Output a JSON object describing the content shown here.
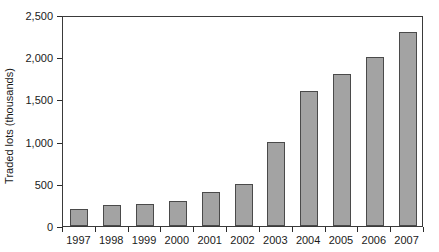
{
  "chart_data": {
    "type": "bar",
    "title": "",
    "subtitle": "",
    "xlabel": "",
    "ylabel": "Traded lots (thousands)",
    "categories": [
      "1997",
      "1998",
      "1999",
      "2000",
      "2001",
      "2002",
      "2003",
      "2004",
      "2005",
      "2006",
      "2007"
    ],
    "values": [
      200,
      250,
      260,
      300,
      400,
      500,
      1000,
      1600,
      1800,
      2000,
      2300
    ],
    "series": [
      {
        "name": "Traded lots",
        "values": [
          200,
          250,
          260,
          300,
          400,
          500,
          1000,
          1600,
          1800,
          2000,
          2300
        ]
      }
    ],
    "ylim": [
      0,
      2500
    ],
    "ytick_values": [
      0,
      500,
      1000,
      1500,
      2000,
      2500
    ],
    "ytick_labels": [
      "0",
      "500",
      "1,000",
      "1,500",
      "2,000",
      "2,500"
    ],
    "grid": false,
    "legend": false,
    "legend_position": "none",
    "bar_color": "#a3a3a3",
    "bar_edge_color": "#4a4a4a",
    "axis_color": "#3a3a3a",
    "text_color": "#1a1a1a",
    "background_color": "#ffffff"
  }
}
